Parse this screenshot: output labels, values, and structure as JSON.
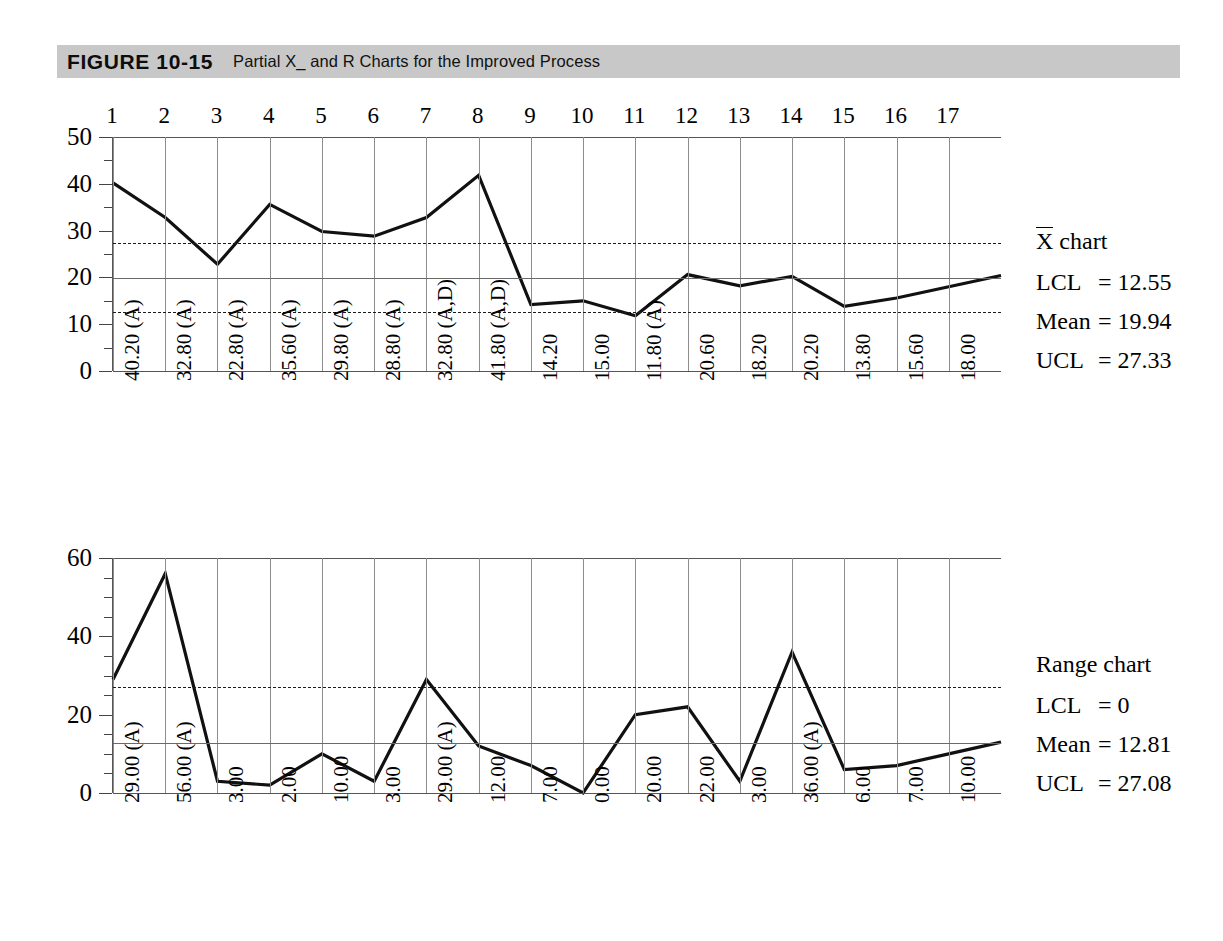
{
  "figure": {
    "label": "FIGURE 10-15",
    "caption": "Partial X_ and R Charts for the Improved Process"
  },
  "chart_data": [
    {
      "type": "line",
      "name": "xbar-chart",
      "title": "X̄ chart",
      "xlabel": "",
      "ylabel": "",
      "ylim": [
        0,
        50
      ],
      "yticks": [
        0,
        10,
        20,
        30,
        40,
        50
      ],
      "yticks_minor": [
        5,
        15,
        25,
        35,
        45
      ],
      "grid": true,
      "x": [
        1,
        2,
        3,
        4,
        5,
        6,
        7,
        8,
        9,
        10,
        11,
        12,
        13,
        14,
        15,
        16,
        17
      ],
      "categories": [
        "1",
        "2",
        "3",
        "4",
        "5",
        "6",
        "7",
        "8",
        "9",
        "10",
        "11",
        "12",
        "13",
        "14",
        "15",
        "16",
        "17"
      ],
      "values": [
        40.2,
        32.8,
        22.8,
        35.6,
        29.8,
        28.8,
        32.8,
        41.8,
        14.2,
        15.0,
        11.8,
        20.6,
        18.2,
        20.2,
        13.8,
        15.6,
        18.0
      ],
      "point_labels": [
        "40.20 (A)",
        "32.80 (A)",
        "22.80 (A)",
        "35.60 (A)",
        "29.80 (A)",
        "28.80 (A)",
        "32.80 (A,D)",
        "41.80 (A,D)",
        "14.20",
        "15.00",
        "11.80 (A)",
        "20.60",
        "18.20",
        "20.20",
        "13.80",
        "15.60",
        "18.00"
      ],
      "limits": {
        "lcl": 12.55,
        "mean": 19.94,
        "ucl": 27.33
      },
      "legend": {
        "title": "X chart",
        "title_overbar": "X",
        "title_rest": " chart",
        "lcl_label": "LCL",
        "mean_label": "Mean",
        "ucl_label": "UCL",
        "lcl_value": "= 12.55",
        "mean_value": "= 19.94",
        "ucl_value": "= 27.33"
      }
    },
    {
      "type": "line",
      "name": "range-chart",
      "title": "Range chart",
      "xlabel": "",
      "ylabel": "",
      "ylim": [
        0,
        60
      ],
      "yticks": [
        0,
        20,
        40,
        60
      ],
      "yticks_minor": [
        5,
        10,
        15,
        25,
        30,
        35,
        45,
        50,
        55
      ],
      "grid": true,
      "x": [
        1,
        2,
        3,
        4,
        5,
        6,
        7,
        8,
        9,
        10,
        11,
        12,
        13,
        14,
        15,
        16,
        17
      ],
      "categories": [
        "1",
        "2",
        "3",
        "4",
        "5",
        "6",
        "7",
        "8",
        "9",
        "10",
        "11",
        "12",
        "13",
        "14",
        "15",
        "16",
        "17"
      ],
      "values": [
        29.0,
        56.0,
        3.0,
        2.0,
        10.0,
        3.0,
        29.0,
        12.0,
        7.0,
        0.0,
        20.0,
        22.0,
        3.0,
        36.0,
        6.0,
        7.0,
        10.0
      ],
      "point_labels": [
        "29.00 (A)",
        "56.00 (A)",
        "3.00",
        "2.00",
        "10.00",
        "3.00",
        "29.00 (A)",
        "12.00",
        "7.00",
        "0.00",
        "20.00",
        "22.00",
        "3.00",
        "36.00 (A)",
        "6.00",
        "7.00",
        "10.00"
      ],
      "limits": {
        "lcl": 0,
        "mean": 12.81,
        "ucl": 27.08
      },
      "legend": {
        "title": "Range chart",
        "lcl_label": "LCL",
        "mean_label": "Mean",
        "ucl_label": "UCL",
        "lcl_value": "= 0",
        "mean_value": "= 12.81",
        "ucl_value": "= 27.08"
      }
    }
  ],
  "colors": {
    "header_band": "#c8c8c8",
    "series_line": "#111111",
    "grid": "#8d8d8d",
    "limit_line": "#1b1b1b"
  }
}
